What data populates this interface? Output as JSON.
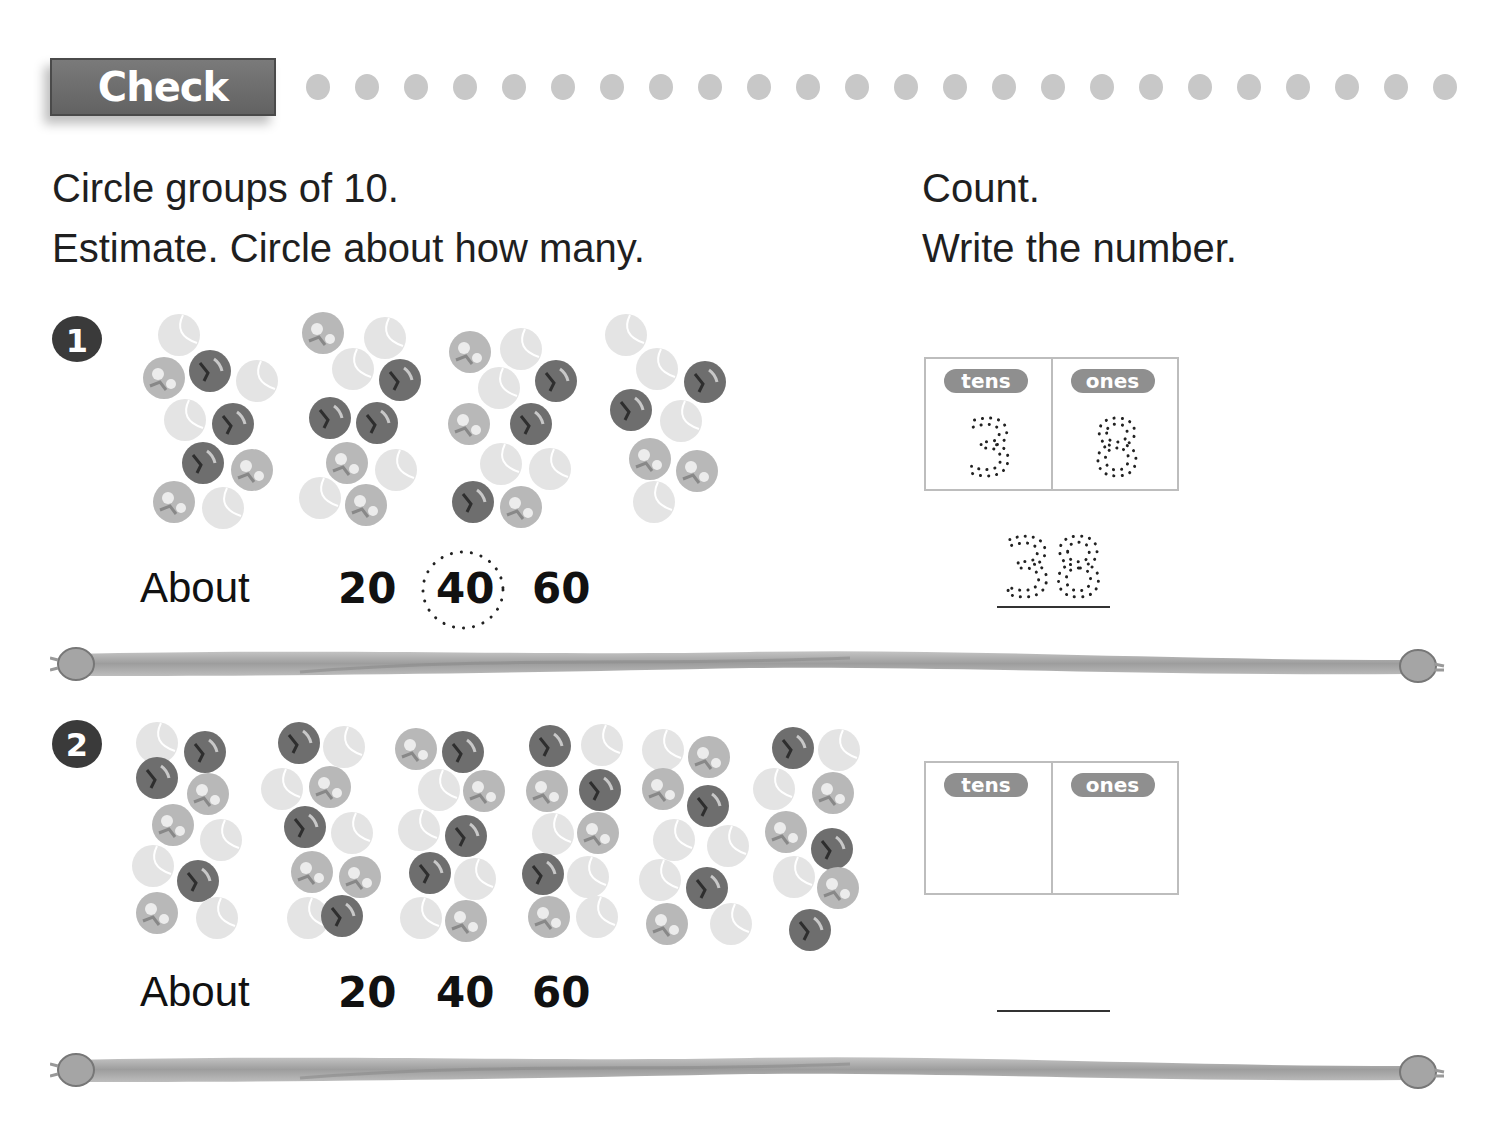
{
  "header": {
    "banner_label": "Check",
    "dot_count": 24,
    "dot_color": "#c8c8c8"
  },
  "instructions": {
    "left_line1": "Circle groups of 10.",
    "left_line2": "Estimate. Circle about how many.",
    "right_line1": "Count.",
    "right_line2": "Write the number."
  },
  "problems": [
    {
      "number": "1",
      "about_label": "About",
      "choices": [
        "20",
        "40",
        "60"
      ],
      "circled_choice": "40",
      "place_value": {
        "tens_label": "tens",
        "ones_label": "ones",
        "tens_value": "3",
        "ones_value": "8"
      },
      "answer": "38",
      "ball_count": 38
    },
    {
      "number": "2",
      "about_label": "About",
      "choices": [
        "20",
        "40",
        "60"
      ],
      "circled_choice": "",
      "place_value": {
        "tens_label": "tens",
        "ones_label": "ones",
        "tens_value": "",
        "ones_value": ""
      },
      "answer": "",
      "ball_count": 59
    }
  ],
  "colors": {
    "ball_light": "#e4e4e4",
    "ball_pattern": "#b8b8b8",
    "ball_dark": "#6e6e6e",
    "rope": "#a9a9a9",
    "banner": "#6a6a6a"
  },
  "balls": {
    "problem1": [
      [
        179,
        335,
        "l"
      ],
      [
        164,
        378,
        "p"
      ],
      [
        210,
        371,
        "d"
      ],
      [
        257,
        381,
        "l"
      ],
      [
        185,
        420,
        "l"
      ],
      [
        233,
        424,
        "d"
      ],
      [
        203,
        463,
        "d"
      ],
      [
        252,
        470,
        "p"
      ],
      [
        174,
        502,
        "p"
      ],
      [
        223,
        508,
        "l"
      ],
      [
        323,
        333,
        "p"
      ],
      [
        385,
        338,
        "l"
      ],
      [
        353,
        369,
        "l"
      ],
      [
        400,
        380,
        "d"
      ],
      [
        330,
        418,
        "d"
      ],
      [
        377,
        423,
        "d"
      ],
      [
        347,
        463,
        "p"
      ],
      [
        396,
        470,
        "l"
      ],
      [
        320,
        498,
        "l"
      ],
      [
        366,
        505,
        "p"
      ],
      [
        470,
        352,
        "p"
      ],
      [
        521,
        349,
        "l"
      ],
      [
        499,
        388,
        "l"
      ],
      [
        556,
        381,
        "d"
      ],
      [
        469,
        424,
        "p"
      ],
      [
        531,
        424,
        "d"
      ],
      [
        501,
        464,
        "l"
      ],
      [
        550,
        469,
        "l"
      ],
      [
        473,
        502,
        "d"
      ],
      [
        521,
        507,
        "p"
      ],
      [
        626,
        335,
        "l"
      ],
      [
        657,
        369,
        "l"
      ],
      [
        705,
        382,
        "d"
      ],
      [
        631,
        410,
        "d"
      ],
      [
        681,
        421,
        "l"
      ],
      [
        650,
        459,
        "p"
      ],
      [
        697,
        471,
        "p"
      ],
      [
        654,
        502,
        "l"
      ]
    ],
    "problem2": [
      [
        157,
        743,
        "l"
      ],
      [
        205,
        752,
        "d"
      ],
      [
        157,
        778,
        "d"
      ],
      [
        208,
        794,
        "p"
      ],
      [
        173,
        825,
        "p"
      ],
      [
        221,
        840,
        "l"
      ],
      [
        153,
        866,
        "l"
      ],
      [
        198,
        881,
        "d"
      ],
      [
        157,
        913,
        "p"
      ],
      [
        217,
        918,
        "l"
      ],
      [
        299,
        743,
        "d"
      ],
      [
        344,
        747,
        "l"
      ],
      [
        282,
        789,
        "l"
      ],
      [
        330,
        787,
        "p"
      ],
      [
        305,
        827,
        "d"
      ],
      [
        352,
        833,
        "l"
      ],
      [
        312,
        872,
        "p"
      ],
      [
        360,
        877,
        "p"
      ],
      [
        308,
        918,
        "l"
      ],
      [
        342,
        916,
        "d"
      ],
      [
        416,
        749,
        "p"
      ],
      [
        463,
        752,
        "d"
      ],
      [
        439,
        790,
        "l"
      ],
      [
        484,
        791,
        "p"
      ],
      [
        419,
        830,
        "l"
      ],
      [
        466,
        836,
        "d"
      ],
      [
        430,
        873,
        "d"
      ],
      [
        475,
        879,
        "l"
      ],
      [
        421,
        918,
        "l"
      ],
      [
        466,
        921,
        "p"
      ],
      [
        550,
        746,
        "d"
      ],
      [
        602,
        745,
        "l"
      ],
      [
        547,
        791,
        "p"
      ],
      [
        600,
        790,
        "d"
      ],
      [
        553,
        834,
        "l"
      ],
      [
        598,
        833,
        "p"
      ],
      [
        543,
        874,
        "d"
      ],
      [
        588,
        877,
        "l"
      ],
      [
        549,
        917,
        "p"
      ],
      [
        597,
        917,
        "l"
      ],
      [
        663,
        750,
        "l"
      ],
      [
        709,
        757,
        "p"
      ],
      [
        663,
        789,
        "p"
      ],
      [
        708,
        806,
        "d"
      ],
      [
        674,
        840,
        "l"
      ],
      [
        728,
        846,
        "l"
      ],
      [
        660,
        880,
        "l"
      ],
      [
        707,
        888,
        "d"
      ],
      [
        667,
        924,
        "p"
      ],
      [
        731,
        924,
        "l"
      ],
      [
        793,
        748,
        "d"
      ],
      [
        839,
        750,
        "l"
      ],
      [
        774,
        789,
        "l"
      ],
      [
        833,
        793,
        "p"
      ],
      [
        786,
        832,
        "p"
      ],
      [
        832,
        849,
        "d"
      ],
      [
        794,
        877,
        "l"
      ],
      [
        838,
        888,
        "p"
      ],
      [
        810,
        930,
        "d"
      ]
    ]
  }
}
